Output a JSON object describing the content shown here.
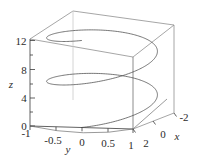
{
  "figure": {
    "kind": "3d-parametric-curve-plot",
    "background_color": "#ffffff",
    "curve_color": "#4a4a4a",
    "box_color": "#8a8a8a",
    "axis_color": "#3a3a3a",
    "text_color": "#2b2b2b"
  },
  "chart_data": {
    "type": "line",
    "title": "",
    "subtitle": "",
    "projection": "3d",
    "curve_name": "helix",
    "xlabel": "x",
    "ylabel": "y",
    "zlabel": "z",
    "xlim": [
      -2,
      2
    ],
    "ylim": [
      -1,
      1
    ],
    "zlim": [
      0,
      12.566
    ],
    "grid": false,
    "legend": null,
    "x_ticks": [
      2,
      0,
      -2
    ],
    "x_tick_labels": [
      "2",
      "0",
      "-2"
    ],
    "y_ticks": [
      -1,
      -0.5,
      0,
      0.5,
      1
    ],
    "y_tick_labels": [
      "-1",
      "-0.5",
      "0",
      "0.5",
      "1"
    ],
    "z_ticks": [
      0,
      4,
      8,
      12
    ],
    "z_tick_labels": [
      "0",
      "4",
      "8",
      "12"
    ],
    "z_minor_ticks": [
      2,
      6,
      10
    ],
    "parametric": {
      "x_expression": "2*cos(t)",
      "y_expression": "sin(t)",
      "z_expression": "t",
      "t_start": 0,
      "t_end": 12.566,
      "turns": 2,
      "samples": 400
    },
    "view": {
      "elev_deg": 12,
      "azim_deg": -62
    }
  },
  "labels": {
    "z": [
      {
        "text": "12",
        "x": 21,
        "y": 41
      },
      {
        "text": "8",
        "x": 24,
        "y": 70
      },
      {
        "text": "4",
        "x": 24,
        "y": 98
      },
      {
        "text": "0",
        "x": 24,
        "y": 126
      }
    ],
    "z_title": {
      "text": "z",
      "x": 11,
      "y": 84
    },
    "y": [
      {
        "text": "-1",
        "x": 26,
        "y": 133
      },
      {
        "text": "-0.5",
        "x": 53,
        "y": 140
      },
      {
        "text": "0",
        "x": 82,
        "y": 142
      },
      {
        "text": "0.5",
        "x": 108,
        "y": 143
      },
      {
        "text": "1",
        "x": 131,
        "y": 145
      }
    ],
    "y_title": {
      "text": "y",
      "x": 68,
      "y": 149
    },
    "x": [
      {
        "text": "2",
        "x": 146,
        "y": 143
      },
      {
        "text": "0",
        "x": 163,
        "y": 134
      },
      {
        "text": "-2",
        "x": 184,
        "y": 117
      }
    ],
    "x_title": {
      "text": "x",
      "x": 177,
      "y": 136
    }
  }
}
